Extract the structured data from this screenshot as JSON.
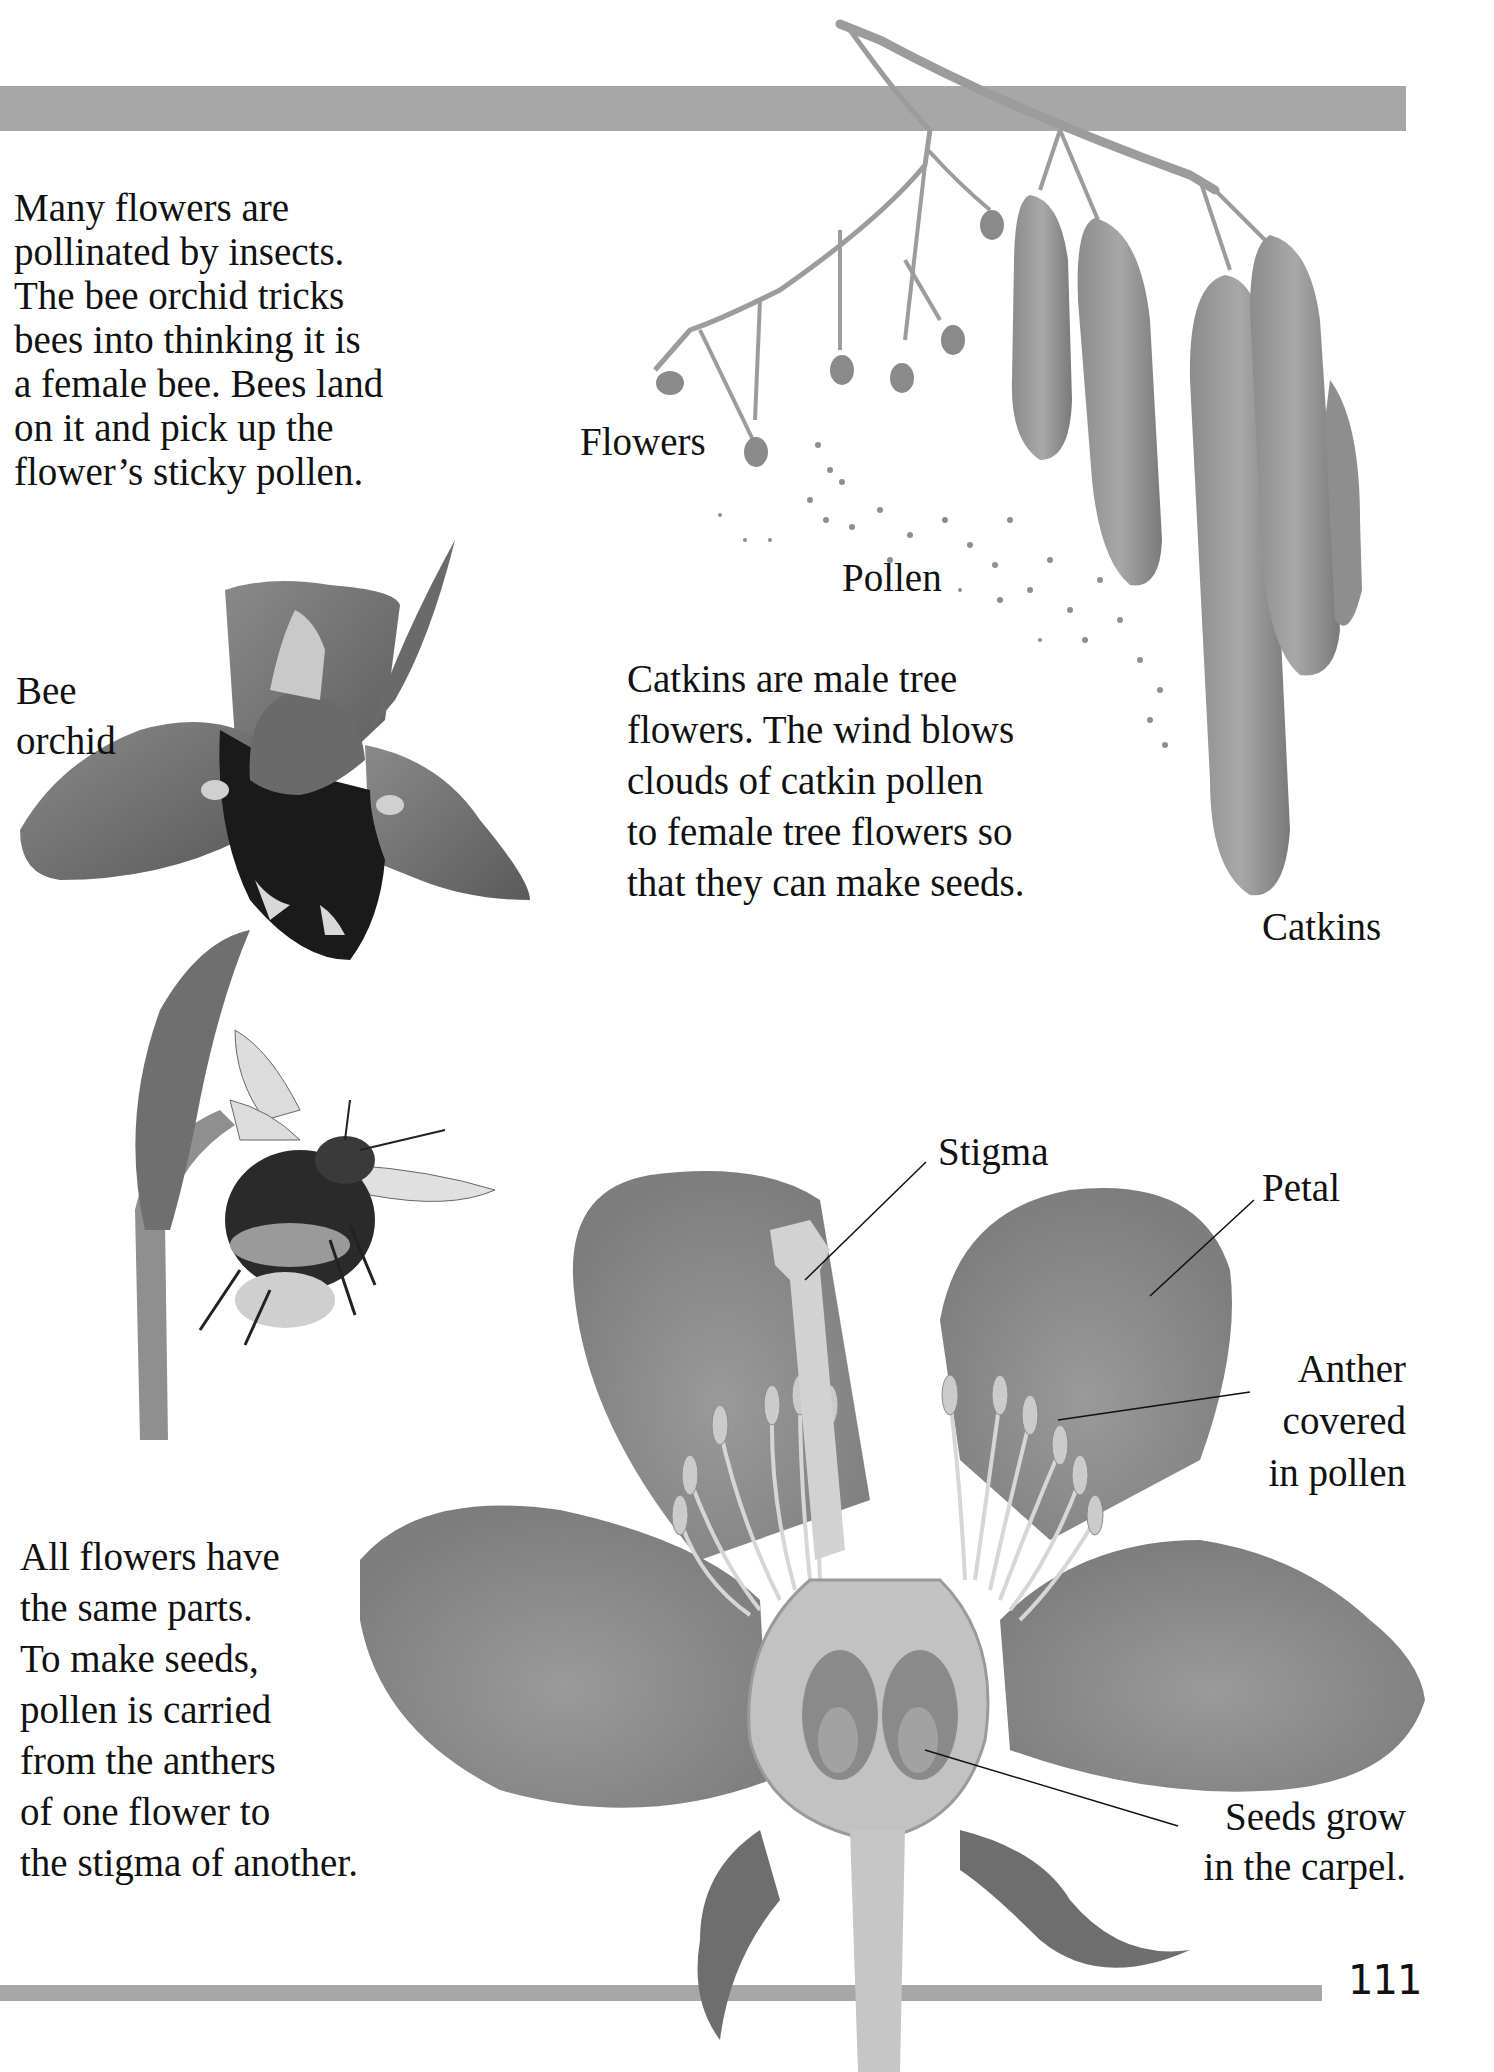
{
  "page": {
    "page_number": "111",
    "bar_color": "#a7a7a7"
  },
  "paragraphs": {
    "pollination": "Many flowers are\npollinated by insects.\nThe bee orchid tricks\nbees into thinking it is\na female bee. Bees land\non it and pick up the\nflower’s sticky pollen.",
    "catkins": "Catkins are male tree\nflowers. The wind blows\nclouds of catkin pollen\nto female tree flowers so\nthat they can make seeds.",
    "flower_parts": "All flowers have\nthe same parts.\nTo make seeds,\npollen is carried\nfrom the anthers\nof one flower to\nthe stigma of another."
  },
  "labels": {
    "flowers": "Flowers",
    "pollen": "Pollen",
    "bee_orchid": "Bee\norchid",
    "catkins": "Catkins",
    "stigma": "Stigma",
    "petal": "Petal",
    "anther": "Anther\ncovered\nin pollen",
    "seeds": "Seeds grow\nin the carpel."
  },
  "illustrations": {
    "catkin_branch": "catkin-branch-illustration",
    "bee_orchid": "bee-orchid-illustration",
    "bumblebee": "bumblebee-illustration",
    "flower_cross_section": "flower-cross-section-illustration"
  }
}
